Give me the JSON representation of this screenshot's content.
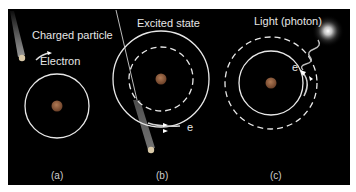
{
  "figure": {
    "background": "#000000",
    "panels": [
      {
        "id": "a",
        "caption": "(a)",
        "labels": {
          "particle": "Charged particle",
          "electron": "Electron"
        }
      },
      {
        "id": "b",
        "caption": "(b)",
        "labels": {
          "state": "Excited state",
          "electron": "e"
        }
      },
      {
        "id": "c",
        "caption": "(c)",
        "labels": {
          "light": "Light (photon)",
          "electron": "e"
        }
      }
    ],
    "colors": {
      "orbit": "#e8e8e8",
      "nucleus": "#8a5a3c",
      "text": "#e6e6e6",
      "glow": "#ffffff"
    }
  }
}
